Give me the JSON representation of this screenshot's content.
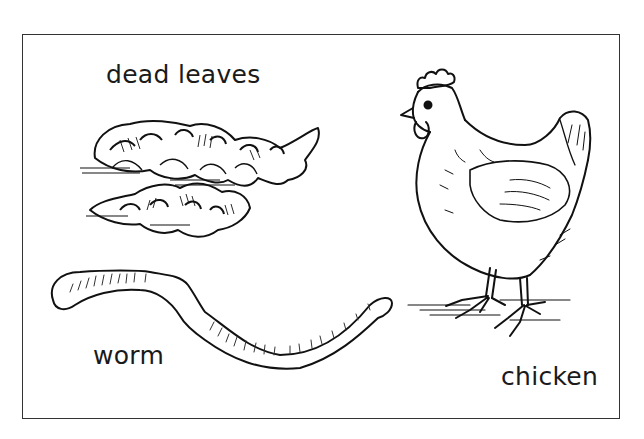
{
  "worksheet": {
    "items": [
      {
        "id": "dead-leaves",
        "label": "dead leaves"
      },
      {
        "id": "worm",
        "label": "worm"
      },
      {
        "id": "chicken",
        "label": "chicken"
      }
    ]
  }
}
